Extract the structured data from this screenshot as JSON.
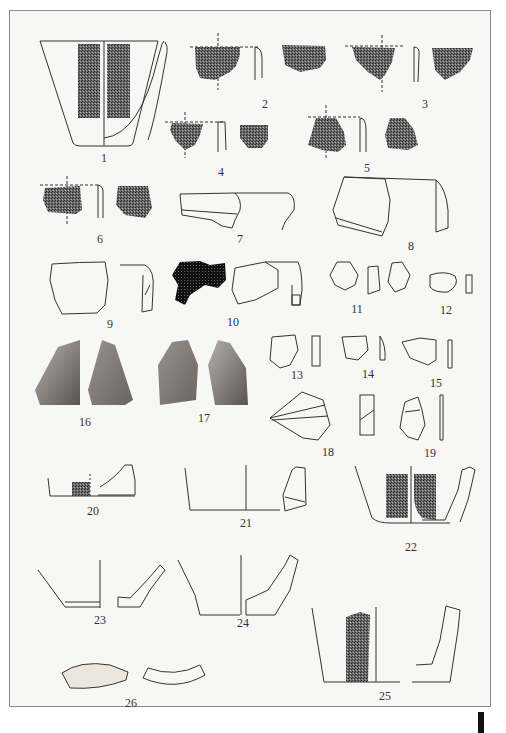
{
  "plate": {
    "description": "Archaeological plate of pottery sherds and stone artifacts",
    "border_color": "#8a8a8a",
    "background": "#f7f7f5",
    "ink_color": "#333333",
    "hatch_color": "#3a3a3a",
    "photo_color": "#8c8580"
  },
  "figures": [
    {
      "id": "1",
      "label": "1",
      "type": "vessel-profile-decorated"
    },
    {
      "id": "2",
      "label": "2",
      "type": "rim-sherd-decorated"
    },
    {
      "id": "3",
      "label": "3",
      "type": "rim-sherd-decorated"
    },
    {
      "id": "4",
      "label": "4",
      "type": "rim-sherd-decorated"
    },
    {
      "id": "5",
      "label": "5",
      "type": "rim-sherd-decorated"
    },
    {
      "id": "6",
      "label": "6",
      "type": "rim-sherd-decorated"
    },
    {
      "id": "7",
      "label": "7",
      "type": "rim-sherd-outline"
    },
    {
      "id": "8",
      "label": "8",
      "type": "rim-sherd-outline"
    },
    {
      "id": "9",
      "label": "9",
      "type": "rim-sherd-outline"
    },
    {
      "id": "10",
      "label": "10",
      "type": "rim-sherd-black"
    },
    {
      "id": "11",
      "label": "11",
      "type": "disc-sherd"
    },
    {
      "id": "12",
      "label": "12",
      "type": "disc-sherd"
    },
    {
      "id": "13",
      "label": "13",
      "type": "disc-sherd"
    },
    {
      "id": "14",
      "label": "14",
      "type": "disc-sherd"
    },
    {
      "id": "15",
      "label": "15",
      "type": "disc-sherd"
    },
    {
      "id": "16",
      "label": "16",
      "type": "stone-photo"
    },
    {
      "id": "17",
      "label": "17",
      "type": "stone-photo"
    },
    {
      "id": "18",
      "label": "18",
      "type": "flake"
    },
    {
      "id": "19",
      "label": "19",
      "type": "flake"
    },
    {
      "id": "20",
      "label": "20",
      "type": "base-profile"
    },
    {
      "id": "21",
      "label": "21",
      "type": "base-profile"
    },
    {
      "id": "22",
      "label": "22",
      "type": "base-profile-decorated"
    },
    {
      "id": "23",
      "label": "23",
      "type": "base-profile"
    },
    {
      "id": "24",
      "label": "24",
      "type": "base-profile"
    },
    {
      "id": "25",
      "label": "25",
      "type": "base-profile-decorated"
    },
    {
      "id": "26",
      "label": "26",
      "type": "curved-fragment"
    }
  ]
}
